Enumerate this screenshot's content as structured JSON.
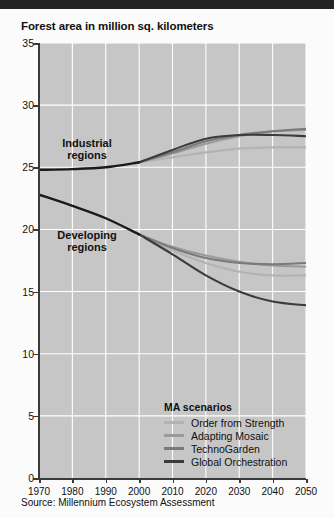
{
  "figure": {
    "title": "Forest area in million sq. kilometers",
    "source": "Source: Millennium Ecosystem Assessment",
    "plot_bg": "#c6c6c6",
    "grid_color": "#ffffff"
  },
  "annotations": [
    {
      "name": "industrial-regions",
      "text": "Industrial\nregions",
      "line1": "Industrial",
      "line2": "regions"
    },
    {
      "name": "developing-regions",
      "text": "Developing\nregions",
      "line1": "Developing",
      "line2": "regions"
    }
  ],
  "legend": {
    "title": "MA scenarios",
    "items": [
      {
        "label": "Order from Strength",
        "color": "#b3b3b3"
      },
      {
        "label": "Adapting Mosaic",
        "color": "#9a9a9a"
      },
      {
        "label": "TechnoGarden",
        "color": "#7a7a7a"
      },
      {
        "label": "Global Orchestration",
        "color": "#3b3b3b"
      }
    ]
  },
  "chart_data": {
    "type": "line",
    "title": "Forest area in million sq. kilometers",
    "xlabel": "",
    "ylabel": "Forest area in million sq. kilometers",
    "xlim": [
      1970,
      2050
    ],
    "ylim": [
      0,
      35
    ],
    "xticks": [
      1970,
      1980,
      1990,
      2000,
      2010,
      2020,
      2030,
      2040,
      2050
    ],
    "yticks": [
      0,
      5,
      10,
      15,
      20,
      25,
      30,
      35
    ],
    "grid": true,
    "legend_position": "inside-bottom-right",
    "groups": [
      {
        "name": "Industrial regions",
        "historical": {
          "name": "Historical",
          "color": "#1a1a1a",
          "x": [
            1970,
            1980,
            1990,
            2000
          ],
          "y": [
            24.8,
            24.85,
            25.0,
            25.4
          ]
        },
        "series": [
          {
            "name": "Order from Strength",
            "color": "#b3b3b3",
            "x": [
              2000,
              2010,
              2020,
              2030,
              2040,
              2050
            ],
            "y": [
              25.4,
              25.8,
              26.2,
              26.5,
              26.6,
              26.6
            ]
          },
          {
            "name": "Adapting Mosaic",
            "color": "#9a9a9a",
            "x": [
              2000,
              2010,
              2020,
              2030,
              2040,
              2050
            ],
            "y": [
              25.4,
              26.1,
              26.9,
              27.5,
              27.9,
              28.0
            ]
          },
          {
            "name": "TechnoGarden",
            "color": "#7a7a7a",
            "x": [
              2000,
              2010,
              2020,
              2030,
              2040,
              2050
            ],
            "y": [
              25.4,
              26.2,
              27.1,
              27.6,
              27.9,
              28.1
            ]
          },
          {
            "name": "Global Orchestration",
            "color": "#3b3b3b",
            "x": [
              2000,
              2010,
              2020,
              2030,
              2040,
              2050
            ],
            "y": [
              25.4,
              26.4,
              27.3,
              27.6,
              27.6,
              27.5
            ]
          }
        ]
      },
      {
        "name": "Developing regions",
        "historical": {
          "name": "Historical",
          "color": "#1a1a1a",
          "x": [
            1970,
            1980,
            1990,
            2000
          ],
          "y": [
            22.8,
            21.9,
            20.9,
            19.6
          ]
        },
        "series": [
          {
            "name": "Order from Strength",
            "color": "#b3b3b3",
            "x": [
              2000,
              2010,
              2020,
              2030,
              2040,
              2050
            ],
            "y": [
              19.6,
              18.3,
              17.3,
              16.6,
              16.3,
              16.3
            ]
          },
          {
            "name": "Adapting Mosaic",
            "color": "#9a9a9a",
            "x": [
              2000,
              2010,
              2020,
              2030,
              2040,
              2050
            ],
            "y": [
              19.6,
              18.6,
              17.9,
              17.4,
              17.1,
              17.0
            ]
          },
          {
            "name": "TechnoGarden",
            "color": "#7a7a7a",
            "x": [
              2000,
              2010,
              2020,
              2030,
              2040,
              2050
            ],
            "y": [
              19.6,
              18.5,
              17.7,
              17.3,
              17.2,
              17.3
            ]
          },
          {
            "name": "Global Orchestration",
            "color": "#3b3b3b",
            "x": [
              2000,
              2010,
              2020,
              2030,
              2040,
              2050
            ],
            "y": [
              19.6,
              18.0,
              16.3,
              15.0,
              14.2,
              13.9
            ]
          }
        ]
      }
    ]
  }
}
